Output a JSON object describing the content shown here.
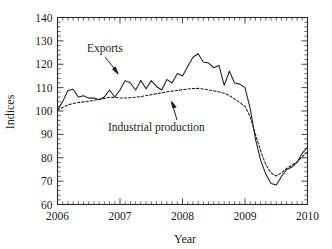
{
  "chart_data": {
    "type": "line",
    "title": "",
    "xlabel": "Year",
    "ylabel": "Indices",
    "xlim": [
      2006.0,
      2010.0
    ],
    "ylim": [
      60,
      140
    ],
    "ytick_step": 10,
    "yticks": [
      60,
      70,
      80,
      90,
      100,
      110,
      120,
      130,
      140
    ],
    "xticks": [
      2006,
      2007,
      2008,
      2009,
      2010
    ],
    "xtick_labels": [
      "2006",
      "2007",
      "2008",
      "2009",
      "2010"
    ],
    "minor_ticks": {
      "x_per_major": 12,
      "y_per_major": 5
    },
    "grid": false,
    "legend": "none",
    "frame": "box",
    "x": [
      2006.0,
      2006.083,
      2006.167,
      2006.25,
      2006.333,
      2006.417,
      2006.5,
      2006.583,
      2006.667,
      2006.75,
      2006.833,
      2006.917,
      2007.0,
      2007.083,
      2007.167,
      2007.25,
      2007.333,
      2007.417,
      2007.5,
      2007.583,
      2007.667,
      2007.75,
      2007.833,
      2007.917,
      2008.0,
      2008.083,
      2008.167,
      2008.25,
      2008.333,
      2008.417,
      2008.5,
      2008.583,
      2008.667,
      2008.75,
      2008.833,
      2008.917,
      2009.0,
      2009.083,
      2009.167,
      2009.25,
      2009.333,
      2009.417,
      2009.5,
      2009.583,
      2009.667,
      2009.75,
      2009.833,
      2009.917,
      2010.0
    ],
    "series": [
      {
        "name": "Exports",
        "style": "solid",
        "annotation": "Exports",
        "values": [
          100.5,
          104.0,
          108.8,
          109.3,
          106.0,
          106.5,
          105.5,
          105.6,
          104.8,
          106.0,
          109.0,
          106.0,
          109.0,
          113.0,
          112.0,
          109.0,
          113.0,
          109.5,
          113.0,
          110.5,
          109.0,
          113.5,
          112.0,
          116.0,
          115.0,
          119.0,
          123.0,
          124.5,
          121.0,
          120.5,
          118.5,
          119.5,
          111.0,
          117.0,
          112.0,
          111.5,
          110.0,
          101.0,
          88.0,
          79.0,
          73.0,
          69.0,
          68.3,
          72.0,
          75.0,
          76.0,
          78.0,
          82.0,
          84.5
        ]
      },
      {
        "name": "Industrial production",
        "style": "dashed",
        "annotation": "Industrial production",
        "values": [
          100.3,
          101.5,
          102.6,
          103.2,
          103.6,
          103.9,
          104.2,
          104.6,
          105.0,
          105.4,
          105.9,
          105.8,
          105.6,
          105.6,
          105.7,
          105.9,
          106.2,
          106.6,
          107.0,
          107.4,
          107.8,
          108.2,
          108.5,
          108.8,
          109.1,
          109.4,
          109.6,
          109.7,
          109.4,
          109.0,
          108.6,
          108.2,
          107.6,
          106.6,
          105.2,
          103.6,
          102.0,
          97.5,
          90.0,
          83.0,
          77.0,
          73.5,
          72.2,
          73.5,
          75.5,
          76.8,
          78.2,
          80.5,
          82.5
        ]
      }
    ],
    "annotations": [
      {
        "text": "Exports",
        "target": "solid-line",
        "arrow": "down-right"
      },
      {
        "text": "Industrial production",
        "target": "dashed-line",
        "arrow": "up"
      }
    ]
  }
}
